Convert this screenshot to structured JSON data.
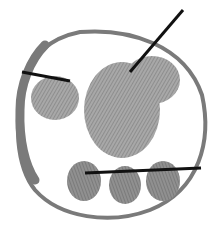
{
  "image": {
    "subject": "paw print inside circular ring with annotation lines",
    "colors": {
      "background": "#ffffff",
      "ring": "#7a7a7a",
      "pad": "#9a9a9a",
      "pad_dark": "#808080",
      "annotation_line": "#111111"
    }
  }
}
